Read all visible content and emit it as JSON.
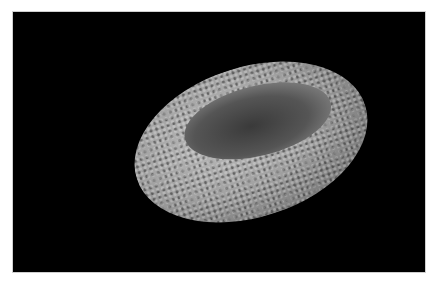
{
  "image": {
    "subject": "granite stone mortar with shallow hollow",
    "background_color": "#000000",
    "stone_colors": [
      "#bdbdbd",
      "#7d7d7d",
      "#3a3a3a"
    ]
  },
  "caption": {
    "text": ""
  }
}
